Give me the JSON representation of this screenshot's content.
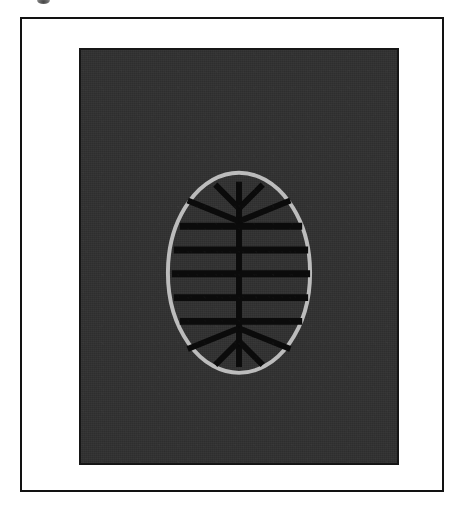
{
  "plate": {
    "background_color": "#ffffff",
    "frame_color": "#121212",
    "panel_color": "#303030",
    "panel_border_color": "#161616"
  },
  "artifact": {
    "name": "scan-smudge",
    "color": "#5a5a5a"
  },
  "figure": {
    "name": "oval-fishbone-glyph",
    "outline_color": "#bcbcbc",
    "mark_color": "#0b0b0b"
  },
  "chart_data": {
    "type": "diagram",
    "title": "",
    "xlabel": "",
    "ylabel": "",
    "viewbox": {
      "width": 320,
      "height": 417
    },
    "oval": {
      "center_x": 160,
      "center_y": 225,
      "radius_x": 72,
      "radius_y": 101,
      "stroke_width": 4,
      "stroke_color": "#bcbcbc"
    },
    "stem": {
      "x": 160,
      "y_top": 133,
      "y_bottom": 320,
      "stroke_width": 6,
      "stroke_color": "#0b0b0b"
    },
    "crossbars": {
      "count": 5,
      "stroke_width": 7,
      "stroke_color": "#0b0b0b",
      "bars": [
        {
          "index": 1,
          "y": 178,
          "x_left": 100,
          "x_right": 224
        },
        {
          "index": 2,
          "y": 202,
          "x_left": 94,
          "x_right": 230
        },
        {
          "index": 3,
          "y": 226,
          "x_left": 92,
          "x_right": 232
        },
        {
          "index": 4,
          "y": 250,
          "x_left": 94,
          "x_right": 230
        },
        {
          "index": 5,
          "y": 274,
          "x_left": 100,
          "x_right": 224
        }
      ]
    },
    "branches": {
      "stroke_width": 6,
      "stroke_color": "#0b0b0b",
      "top_inner": [
        {
          "x1": 160,
          "y1": 160,
          "x2": 136,
          "y2": 136
        },
        {
          "x1": 160,
          "y1": 160,
          "x2": 184,
          "y2": 136
        }
      ],
      "top_outer": [
        {
          "x1": 160,
          "y1": 173,
          "x2": 108,
          "y2": 152
        },
        {
          "x1": 160,
          "y1": 173,
          "x2": 212,
          "y2": 152
        }
      ],
      "bottom_outer": [
        {
          "x1": 160,
          "y1": 281,
          "x2": 108,
          "y2": 302
        },
        {
          "x1": 160,
          "y1": 281,
          "x2": 212,
          "y2": 302
        }
      ],
      "bottom_inner": [
        {
          "x1": 160,
          "y1": 294,
          "x2": 136,
          "y2": 318
        },
        {
          "x1": 160,
          "y1": 294,
          "x2": 184,
          "y2": 318
        }
      ]
    }
  }
}
